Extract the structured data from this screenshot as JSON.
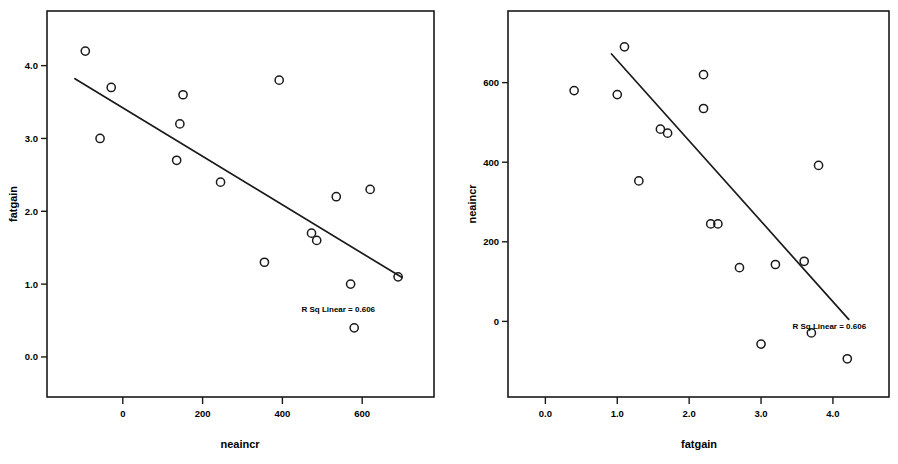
{
  "page": {
    "title": "Scatterplot pair: fatgain vs neaincr",
    "background": "#ffffff",
    "ink": "#1a1a1a"
  },
  "chart_data": [
    {
      "id": "left",
      "type": "scatter",
      "title": "",
      "xlabel": "neaincr",
      "ylabel": "fatgain",
      "xlim": [
        -190,
        780
      ],
      "ylim": [
        -0.55,
        4.75
      ],
      "xticks": [
        0,
        200,
        400,
        600
      ],
      "xticklabels": [
        "0",
        "200",
        "400",
        "600"
      ],
      "yticks": [
        0.0,
        1.0,
        2.0,
        3.0,
        4.0
      ],
      "yticklabels": [
        "0.0",
        "1.0",
        "2.0",
        "3.0",
        "4.0"
      ],
      "grid": false,
      "legend": "none",
      "marker": "open-circle",
      "x": [
        -94,
        -57,
        -29,
        135,
        143,
        151,
        245,
        355,
        392,
        473,
        486,
        535,
        571,
        580,
        620,
        690
      ],
      "y": [
        4.2,
        3.0,
        3.7,
        2.7,
        3.2,
        3.6,
        2.4,
        1.3,
        3.8,
        1.7,
        1.6,
        2.2,
        1.0,
        0.4,
        2.3,
        1.1
      ],
      "fit_line": {
        "type": "linear",
        "x": [
          -120,
          700
        ],
        "y": [
          3.82,
          1.09
        ]
      },
      "annotation": {
        "text": "R Sq Linear = 0.606",
        "x": 540,
        "y": 0.62
      }
    },
    {
      "id": "right",
      "type": "scatter",
      "title": "",
      "xlabel": "fatgain",
      "ylabel": "neaincr",
      "xlim": [
        -0.52,
        4.78
      ],
      "ylim": [
        -190,
        780
      ],
      "xticks": [
        0.0,
        1.0,
        2.0,
        3.0,
        4.0
      ],
      "xticklabels": [
        "0.0",
        "1.0",
        "2.0",
        "3.0",
        "4.0"
      ],
      "yticks": [
        0,
        200,
        400,
        600
      ],
      "yticklabels": [
        "0",
        "200",
        "400",
        "600"
      ],
      "grid": false,
      "legend": "none",
      "marker": "open-circle",
      "x": [
        0.4,
        1.0,
        1.1,
        1.3,
        1.6,
        1.7,
        2.2,
        2.2,
        2.3,
        2.4,
        2.7,
        3.0,
        3.2,
        3.6,
        3.7,
        3.8,
        4.2
      ],
      "y": [
        580,
        570,
        690,
        353,
        483,
        473,
        620,
        535,
        245,
        245,
        135,
        -57,
        143,
        151,
        -29,
        392,
        -94
      ],
      "fit_line": {
        "type": "linear",
        "x": [
          0.92,
          4.22
        ],
        "y": [
          672,
          5
        ]
      },
      "annotation": {
        "text": "R Sq Linear = 0.606",
        "x": 3.95,
        "y": -18
      }
    }
  ]
}
